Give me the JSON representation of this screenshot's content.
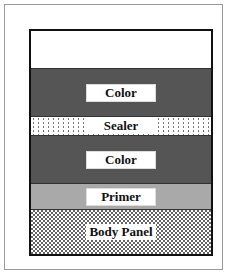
{
  "diagram": {
    "title": "",
    "layers": [
      {
        "id": "clear",
        "label": ""
      },
      {
        "id": "color_top",
        "label": "Color"
      },
      {
        "id": "sealer",
        "label": "Sealer"
      },
      {
        "id": "color_bottom",
        "label": "Color"
      },
      {
        "id": "primer",
        "label": "Primer"
      },
      {
        "id": "body_panel",
        "label": "Body Panel"
      }
    ]
  }
}
